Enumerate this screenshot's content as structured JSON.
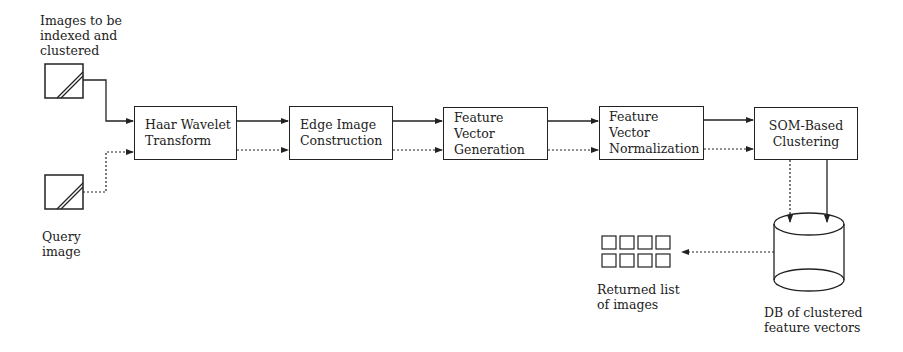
{
  "diagram": {
    "inputs": [
      {
        "id": "index-images",
        "label": "Images to be\nindexed and\nclustered"
      },
      {
        "id": "query-image",
        "label": "Query\nimage"
      }
    ],
    "stages": [
      {
        "id": "haar",
        "label": "Haar Wavelet\nTransform"
      },
      {
        "id": "edge",
        "label": "Edge Image\nConstruction"
      },
      {
        "id": "fv-gen",
        "label": "Feature Vector\nGeneration"
      },
      {
        "id": "fv-norm",
        "label": "Feature Vector\nNormalization"
      },
      {
        "id": "som",
        "label": "SOM-Based\nClustering"
      }
    ],
    "database": {
      "label": "DB of clustered\nfeature vectors"
    },
    "output": {
      "label": "Returned list\nof images",
      "thumbnail_rows": 2,
      "thumbnail_cols": 4
    },
    "edge_styles": {
      "indexing_path": "solid",
      "query_path": "dotted"
    }
  }
}
